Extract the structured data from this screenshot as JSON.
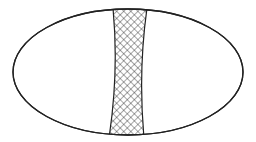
{
  "diagram": {
    "shape": "ellipse",
    "ellipse": {
      "cx": 128,
      "cy": 72,
      "rx": 115,
      "ry": 63,
      "stroke": "#222222",
      "fill": "#ffffff"
    },
    "band": {
      "pattern": "crosshatch",
      "top_left_x": 113,
      "top_right_x": 147,
      "top_y": 10,
      "mid_left_x": 119,
      "mid_right_x": 138,
      "mid_y": 72,
      "bottom_left_x": 109,
      "bottom_right_x": 144,
      "bottom_y": 135,
      "stroke": "#222222"
    }
  }
}
